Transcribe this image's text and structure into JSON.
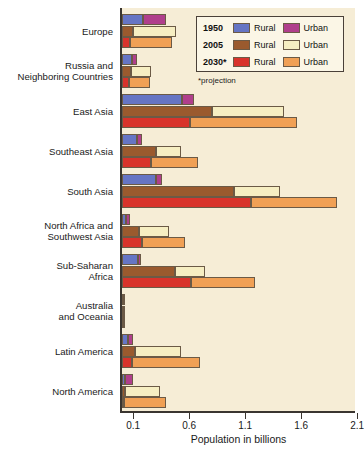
{
  "chart_data": {
    "type": "bar",
    "title": "",
    "subtitle": "",
    "xlabel": "Population in billions",
    "ylabel": "",
    "orientation": "horizontal",
    "stacked": true,
    "xlim": [
      0,
      2.1
    ],
    "xticks": [
      0.1,
      0.6,
      1.1,
      1.6,
      2.1
    ],
    "xtick_labels": [
      "0.1",
      "0.6",
      "1.1",
      "1.6",
      "2.1"
    ],
    "grid": false,
    "legend_position": "top-right",
    "footnote": "*projection",
    "categories": [
      "Europe",
      "Russia and\nNeighboring Countries",
      "East Asia",
      "Southeast Asia",
      "South Asia",
      "North Africa and\nSouthwest Asia",
      "Sub-Saharan\nAfrica",
      "Australia\nand Oceania",
      "Latin America",
      "North America"
    ],
    "series": [
      {
        "name": "1950 Rural",
        "year": "1950",
        "type": "Rural",
        "color": "#6675c4",
        "values": [
          0.19,
          0.09,
          0.54,
          0.13,
          0.3,
          0.04,
          0.14,
          0.01,
          0.05,
          0.03
        ]
      },
      {
        "name": "1950 Urban",
        "year": "1950",
        "type": "Urban",
        "color": "#b03f8c",
        "values": [
          0.2,
          0.04,
          0.1,
          0.05,
          0.06,
          0.03,
          0.03,
          0.01,
          0.05,
          0.07
        ]
      },
      {
        "name": "2005 Rural",
        "year": "2005",
        "type": "Rural",
        "color": "#9a5a2e",
        "values": [
          0.1,
          0.08,
          0.8,
          0.3,
          1.0,
          0.15,
          0.47,
          0.01,
          0.12,
          0.03
        ]
      },
      {
        "name": "2005 Urban",
        "year": "2005",
        "type": "Urban",
        "color": "#f6eec2",
        "values": [
          0.38,
          0.18,
          0.65,
          0.23,
          0.41,
          0.27,
          0.27,
          0.02,
          0.41,
          0.31
        ]
      },
      {
        "name": "2030* Rural",
        "year": "2030*",
        "type": "Rural",
        "color": "#d8332b",
        "values": [
          0.07,
          0.06,
          0.61,
          0.26,
          1.15,
          0.18,
          0.62,
          0.01,
          0.09,
          0.02
        ]
      },
      {
        "name": "2030* Urban",
        "year": "2030*",
        "type": "Urban",
        "color": "#f0a055",
        "values": [
          0.38,
          0.19,
          0.95,
          0.42,
          0.77,
          0.38,
          0.57,
          0.02,
          0.61,
          0.37
        ]
      }
    ]
  },
  "legend": {
    "rows": [
      {
        "year": "1950",
        "rural_label": "Rural",
        "rural_color": "#6675c4",
        "urban_label": "Urban",
        "urban_color": "#b03f8c"
      },
      {
        "year": "2005",
        "rural_label": "Rural",
        "rural_color": "#9a5a2e",
        "urban_label": "Urban",
        "urban_color": "#f6eec2"
      },
      {
        "year": "2030*",
        "rural_label": "Rural",
        "rural_color": "#d8332b",
        "urban_label": "Urban",
        "urban_color": "#f0a055"
      }
    ],
    "footnote": "*projection"
  },
  "colors": {
    "plot_background": "#f6edd6",
    "page_background": "#ffffff",
    "axis": "#3a3530",
    "bar_outline": "#6b5a46"
  }
}
